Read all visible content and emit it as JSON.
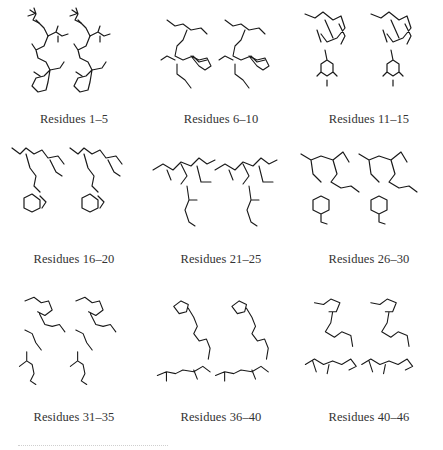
{
  "figure": {
    "panels": [
      {
        "caption": "Residues 1–5",
        "image": "stereo-pair-molecular-structure"
      },
      {
        "caption": "Residues 6–10",
        "image": "stereo-pair-molecular-structure"
      },
      {
        "caption": "Residues 11–15",
        "image": "stereo-pair-molecular-structure"
      },
      {
        "caption": "Residues 16–20",
        "image": "stereo-pair-molecular-structure"
      },
      {
        "caption": "Residues 21–25",
        "image": "stereo-pair-molecular-structure"
      },
      {
        "caption": "Residues 26–30",
        "image": "stereo-pair-molecular-structure"
      },
      {
        "caption": "Residues 31–35",
        "image": "stereo-pair-molecular-structure"
      },
      {
        "caption": "Residues 36–40",
        "image": "stereo-pair-molecular-structure"
      },
      {
        "caption": "Residues 40–46",
        "image": "stereo-pair-molecular-structure"
      }
    ]
  }
}
